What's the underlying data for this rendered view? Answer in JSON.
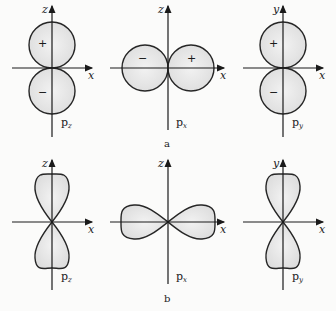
{
  "figure": {
    "row_a": {
      "label": "a",
      "panels": [
        {
          "vertical_axis": "z",
          "horizontal_axis": "x",
          "orbital": "p",
          "orbital_sub": "z",
          "sign_upper": "+",
          "sign_lower": "−"
        },
        {
          "vertical_axis": "z",
          "horizontal_axis": "x",
          "orbital": "p",
          "orbital_sub": "x",
          "sign_left": "−",
          "sign_right": "+"
        },
        {
          "vertical_axis": "y",
          "horizontal_axis": "x",
          "orbital": "p",
          "orbital_sub": "y",
          "sign_upper": "+",
          "sign_lower": "−"
        }
      ]
    },
    "row_b": {
      "label": "b",
      "panels": [
        {
          "vertical_axis": "z",
          "horizontal_axis": "x",
          "orbital": "p",
          "orbital_sub": "z"
        },
        {
          "vertical_axis": "z",
          "horizontal_axis": "x",
          "orbital": "p",
          "orbital_sub": "x"
        },
        {
          "vertical_axis": "y",
          "horizontal_axis": "x",
          "orbital": "p",
          "orbital_sub": "y"
        }
      ]
    },
    "colors": {
      "lobe_fill": "#e4e4e4",
      "stroke": "#262626",
      "background": "#fbfbfa"
    }
  }
}
